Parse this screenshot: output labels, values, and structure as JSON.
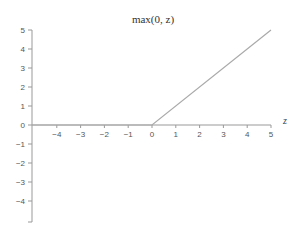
{
  "chart_data": {
    "type": "line",
    "title": "max(0, z)",
    "xlabel": "z",
    "ylabel": "",
    "xlim": [
      -5,
      5
    ],
    "ylim": [
      -5.5,
      5
    ],
    "x_ticks": [
      -4,
      -3,
      -2,
      -1,
      0,
      1,
      2,
      3,
      4,
      5
    ],
    "x_tick_labels": [
      "−4",
      "−3",
      "−2",
      "−1",
      "0",
      "1",
      "2",
      "3",
      "4",
      "5"
    ],
    "y_ticks": [
      5,
      4,
      3,
      2,
      1,
      0,
      -1,
      -2,
      -3,
      -4
    ],
    "y_tick_labels": [
      "5",
      "4",
      "3",
      "2",
      "1",
      "0",
      "−1",
      "−2",
      "−3",
      "−4"
    ],
    "grid": false,
    "legend": null,
    "series": [
      {
        "name": "max(0, z)",
        "x": [
          -5,
          0,
          5
        ],
        "y": [
          0,
          0,
          5
        ],
        "color": "#aaaaaa"
      }
    ]
  },
  "colors": {
    "axis": "#999999",
    "line": "#aaaaaa",
    "text": "#555555"
  }
}
